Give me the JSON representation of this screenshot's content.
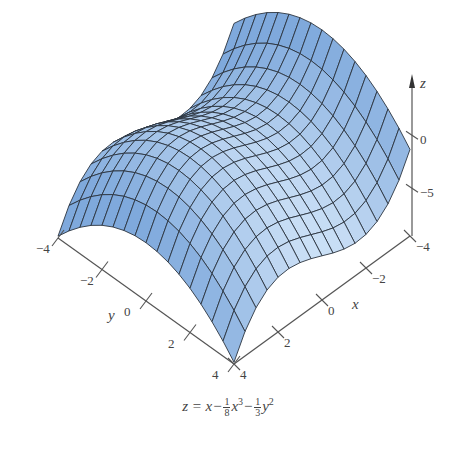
{
  "chart_data": {
    "type": "surface3d",
    "title": "",
    "function": "z = x - (1/8)x^3 - (1/3)y^2",
    "caption": {
      "lhs": "z = x",
      "term1_num": "1",
      "term1_den": "8",
      "term1_var": "x",
      "term1_pow": "3",
      "term2_num": "1",
      "term2_den": "3",
      "term2_var": "y",
      "term2_pow": "2",
      "minus": "−"
    },
    "xlabel": "x",
    "ylabel": "y",
    "zlabel": "z",
    "x_range": [
      -4,
      4
    ],
    "y_range": [
      -4,
      4
    ],
    "z_range": [
      -9.5,
      4
    ],
    "x_ticks": [
      {
        "v": -4,
        "label": "−4"
      },
      {
        "v": -2,
        "label": "−2"
      },
      {
        "v": 0,
        "label": "0"
      },
      {
        "v": 2,
        "label": "2"
      },
      {
        "v": 4,
        "label": "4"
      }
    ],
    "y_ticks": [
      {
        "v": -4,
        "label": "−4"
      },
      {
        "v": -2,
        "label": "−2"
      },
      {
        "v": 0,
        "label": "0"
      },
      {
        "v": 2,
        "label": "2"
      },
      {
        "v": 4,
        "label": "4"
      }
    ],
    "z_ticks": [
      {
        "v": 0,
        "label": "0"
      },
      {
        "v": -5,
        "label": "−5"
      }
    ],
    "grid_divisions": 16,
    "colors": {
      "surface_light": "#d6e8fa",
      "surface_dark": "#7fa9dc",
      "mesh": "#2b3440",
      "axis": "#555555"
    }
  }
}
